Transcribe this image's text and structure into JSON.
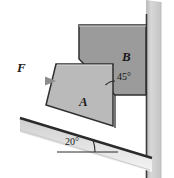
{
  "figure": {
    "type": "engineering-mechanics-free-body-diagram",
    "background_color": "#ffffff"
  },
  "labels": {
    "force": "F",
    "block_a": "A",
    "block_b": "B",
    "angle_interface": "45°",
    "angle_incline": "20°"
  },
  "colors": {
    "block_a_fill": "#b9b9b9",
    "block_b_fill": "#9b9b9b",
    "wall_fill": "#d3d3d3",
    "ground_fill": "#dcdcdc",
    "outline": "#2b2b2b",
    "arrow": "#8a8a8a",
    "text": "#1a1a1a"
  },
  "geometry": {
    "angles": {
      "incline_degrees": 20,
      "interface_degrees": 45
    },
    "block_a_polygon": "56,64 113,64 113,126 46,104",
    "block_b_polygon": "79,25 146,25 146,95 115,95 79,59",
    "wall_band": "146,0 160,0 160,178 146,178",
    "ground_line": "20,118 152,158",
    "force_arrow": {
      "from_x": 18,
      "from_y": 81,
      "to_x": 56,
      "to_y": 81
    }
  },
  "icons": {
    "arrow": "arrow-right-icon",
    "arc_45": "angle-arc-icon",
    "arc_20": "angle-arc-icon"
  }
}
